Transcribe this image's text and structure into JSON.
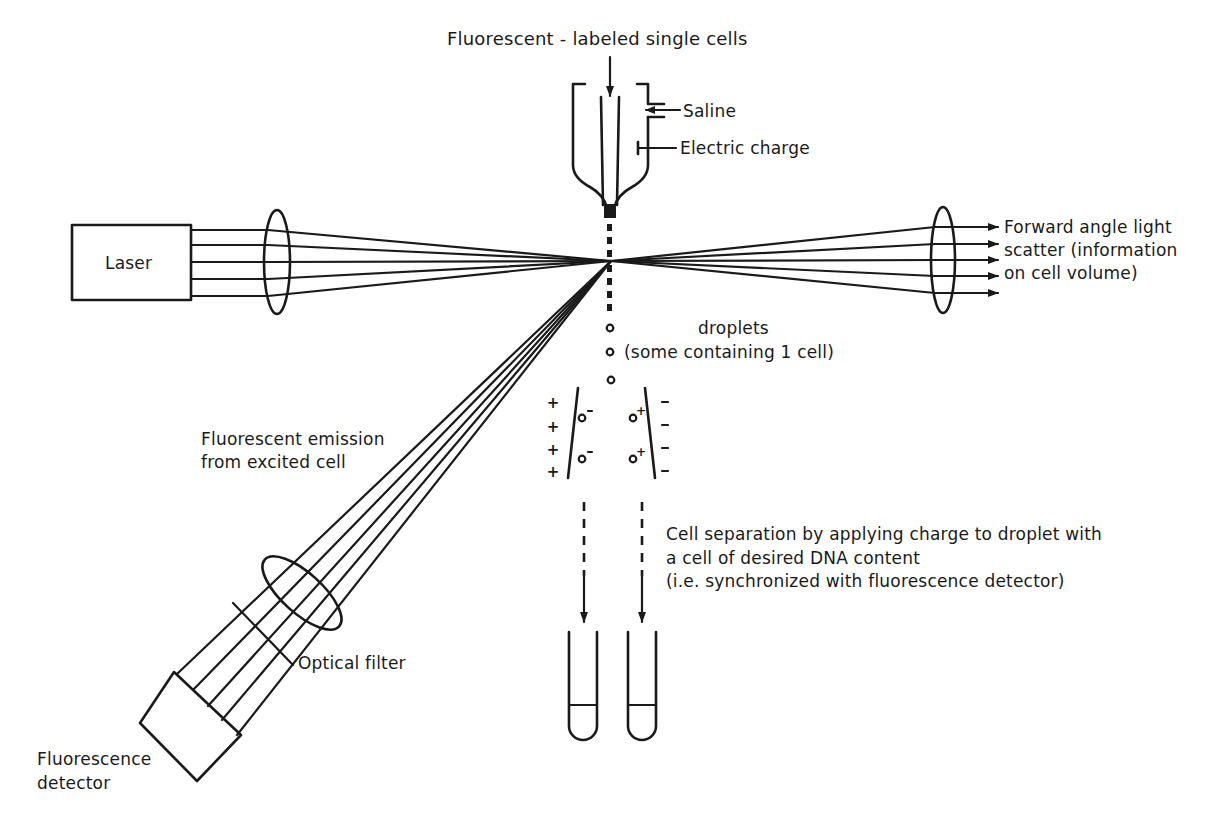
{
  "diagram": {
    "labels": {
      "input_cells": "Fluorescent - labeled single cells",
      "saline": "Saline",
      "electric_charge": "Electric charge",
      "laser": "Laser",
      "forward_scatter": [
        "Forward angle light",
        "scatter (information",
        "on cell volume)"
      ],
      "droplets": [
        "droplets",
        "(some containing 1 cell)"
      ],
      "fluorescent_emission": [
        "Fluorescent emission",
        "from excited cell"
      ],
      "cell_separation": [
        "Cell separation by applying charge to droplet with",
        "a cell of desired DNA content",
        "(i.e. synchronized with fluorescence detector)"
      ],
      "optical_filter": "Optical filter",
      "fluorescence_detector": [
        "Fluorescence",
        "detector"
      ]
    },
    "deflection_plates": {
      "left_plate_charge": "+",
      "right_plate_charge": "-",
      "left_droplet_charge": "-",
      "right_droplet_charge": "+"
    },
    "components": [
      "nozzle",
      "saline-inlet",
      "electrode",
      "laser",
      "focusing-lens",
      "collection-lens",
      "forward-scatter-beams",
      "droplet-stream",
      "deflection-plates",
      "collection-tubes",
      "emission-lens",
      "optical-filter",
      "fluorescence-detector"
    ],
    "colors": {
      "ink": "#1a1a1a",
      "background": "#ffffff"
    }
  }
}
